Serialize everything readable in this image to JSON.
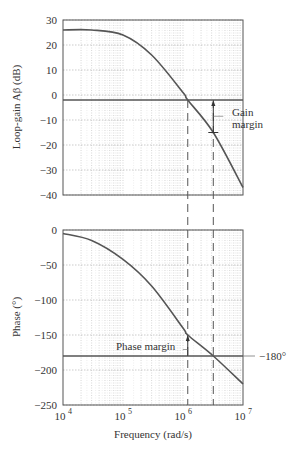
{
  "chart_data": [
    {
      "type": "line",
      "title": "",
      "xlabel": "",
      "ylabel": "Loop-gain Aβ (dB)",
      "xscale": "log",
      "xlim": [
        10000,
        10000000
      ],
      "ylim": [
        -40,
        30
      ],
      "yticks": [
        "30",
        "20",
        "10",
        "0",
        "-10",
        "-20",
        "-30",
        "-40"
      ],
      "grid": true,
      "series": [
        {
          "name": "Loop gain",
          "x": [
            10000,
            30000,
            100000,
            300000,
            1000000,
            1200000,
            3200000,
            10000000
          ],
          "values": [
            26,
            26,
            24,
            16,
            1,
            -2,
            -15,
            -37
          ]
        }
      ],
      "reference_line": {
        "y": -2,
        "label": ""
      },
      "annotations": [
        {
          "text": "Gain",
          "line2": "margin"
        }
      ]
    },
    {
      "type": "line",
      "title": "",
      "xlabel": "Frequency (rad/s)",
      "ylabel": "Phase (°)",
      "xscale": "log",
      "xlim": [
        10000,
        10000000
      ],
      "ylim": [
        -250,
        0
      ],
      "yticks": [
        "0",
        "-50",
        "-100",
        "-150",
        "-200",
        "-250"
      ],
      "xticks": [
        "10",
        "10",
        "10",
        "10"
      ],
      "xtick_exps": [
        "4",
        "5",
        "6",
        "7"
      ],
      "grid": true,
      "series": [
        {
          "name": "Phase",
          "x": [
            10000,
            30000,
            100000,
            300000,
            1000000,
            1200000,
            3200000,
            10000000
          ],
          "values": [
            -5,
            -15,
            -42,
            -80,
            -140,
            -150,
            -180,
            -220
          ]
        }
      ],
      "reference_line": {
        "y": -180,
        "label": "−180°"
      },
      "annotations": [
        {
          "text": "Phase margin"
        }
      ]
    }
  ],
  "labels": {
    "top_ylabel": "Loop-gain Aβ (dB)",
    "bottom_ylabel": "Phase (°)",
    "xlabel": "Frequency (rad/s)",
    "gain_margin_1": "Gain",
    "gain_margin_2": "margin",
    "phase_margin": "Phase margin",
    "ref_180": "−180°"
  }
}
